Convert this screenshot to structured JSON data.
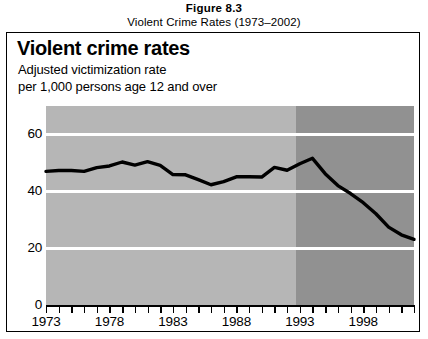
{
  "caption": {
    "figure_number": "Figure 8.3",
    "figure_title": "Violent Crime Rates (1973–2002)"
  },
  "chart_header": {
    "heading": "Violent crime rates",
    "subtitle_line1": "Adjusted victimization rate",
    "subtitle_line2": "per 1,000 persons age 12 and over"
  },
  "colors": {
    "plot_background_light": "#b6b6b6",
    "plot_background_dark": "#919191",
    "gridline": "#ffffff",
    "series_line": "#000000",
    "frame_border": "#000000"
  },
  "chart_data": {
    "type": "line",
    "title": "Violent crime rates",
    "subtitle": "Adjusted victimization rate per 1,000 persons age 12 and over",
    "xlabel": "",
    "ylabel": "",
    "xlim": [
      1973,
      2002
    ],
    "ylim": [
      0,
      70
    ],
    "grid": true,
    "legend": "none",
    "y_ticks": [
      0,
      20,
      40,
      60
    ],
    "y_tick_labels": [
      "0",
      "20",
      "40",
      "60"
    ],
    "x_ticks": [
      1973,
      1974,
      1975,
      1976,
      1977,
      1978,
      1979,
      1980,
      1981,
      1982,
      1983,
      1984,
      1985,
      1986,
      1987,
      1988,
      1989,
      1990,
      1991,
      1992,
      1993,
      1994,
      1995,
      1996,
      1997,
      1998,
      1999,
      2000,
      2001,
      2002
    ],
    "x_tick_labels": [
      "1973",
      "1978",
      "1983",
      "1988",
      "1993",
      "1998"
    ],
    "x_labeled_ticks": [
      1973,
      1978,
      1983,
      1988,
      1993,
      1998
    ],
    "shaded_regions": [
      {
        "name": "light-band",
        "x_start": 1973,
        "x_end": 1992.7,
        "color": "#b6b6b6"
      },
      {
        "name": "dark-band",
        "x_start": 1992.7,
        "x_end": 2002,
        "color": "#919191"
      }
    ],
    "x": [
      1973,
      1974,
      1975,
      1976,
      1977,
      1978,
      1979,
      1980,
      1981,
      1982,
      1983,
      1984,
      1985,
      1986,
      1987,
      1988,
      1989,
      1990,
      1991,
      1992,
      1993,
      1994,
      1995,
      1996,
      1997,
      1998,
      1999,
      2000,
      2001,
      2002
    ],
    "values": [
      47.0,
      47.3,
      47.3,
      47.0,
      48.3,
      48.9,
      50.3,
      49.2,
      50.4,
      49.1,
      45.9,
      45.8,
      44.1,
      42.3,
      43.4,
      45.1,
      45.1,
      45.0,
      48.4,
      47.4,
      49.7,
      51.6,
      46.2,
      42.0,
      39.2,
      36.0,
      32.1,
      27.4,
      24.7,
      23.1
    ]
  }
}
